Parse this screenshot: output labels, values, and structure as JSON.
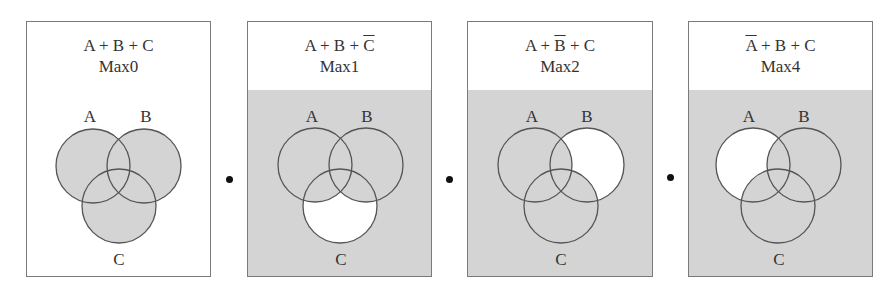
{
  "diagram": {
    "type": "venn-product-of-maxterms",
    "colors": {
      "shaded": "#d4d4d4",
      "unshaded": "#ffffff",
      "stroke": "#555555",
      "border": "#7a7a7a"
    },
    "separator": "•",
    "panels": [
      {
        "expression_parts": [
          {
            "t": "A",
            "bar": false
          },
          {
            "t": " + ",
            "bar": false
          },
          {
            "t": "B",
            "bar": false
          },
          {
            "t": " + ",
            "bar": false
          },
          {
            "t": "C",
            "bar": false
          }
        ],
        "expression": "A + B + C",
        "maxterm": "Max0",
        "labels": {
          "a": "A",
          "b": "B",
          "c": "C"
        },
        "background_shaded": false,
        "shaded_region": "A ∪ B ∪ C",
        "white_region": "outside circles"
      },
      {
        "expression_parts": [
          {
            "t": "A",
            "bar": false
          },
          {
            "t": " + ",
            "bar": false
          },
          {
            "t": "B",
            "bar": false
          },
          {
            "t": " + ",
            "bar": false
          },
          {
            "t": "C",
            "bar": true
          }
        ],
        "expression": "A + B + C̄",
        "maxterm": "Max1",
        "labels": {
          "a": "A",
          "b": "B",
          "c": "C"
        },
        "background_shaded": true,
        "white_region": "C only (not A, not B)"
      },
      {
        "expression_parts": [
          {
            "t": "A",
            "bar": false
          },
          {
            "t": " + ",
            "bar": false
          },
          {
            "t": "B",
            "bar": true
          },
          {
            "t": " + ",
            "bar": false
          },
          {
            "t": "C",
            "bar": false
          }
        ],
        "expression": "A + B̄ + C",
        "maxterm": "Max2",
        "labels": {
          "a": "A",
          "b": "B",
          "c": "C"
        },
        "background_shaded": true,
        "white_region": "B only (not A, not C)"
      },
      {
        "expression_parts": [
          {
            "t": "A",
            "bar": true
          },
          {
            "t": " + ",
            "bar": false
          },
          {
            "t": "B",
            "bar": false
          },
          {
            "t": " + ",
            "bar": false
          },
          {
            "t": "C",
            "bar": false
          }
        ],
        "expression": "Ā + B + C",
        "maxterm": "Max4",
        "labels": {
          "a": "A",
          "b": "B",
          "c": "C"
        },
        "background_shaded": true,
        "white_region": "A only (not B, not C)"
      }
    ]
  }
}
